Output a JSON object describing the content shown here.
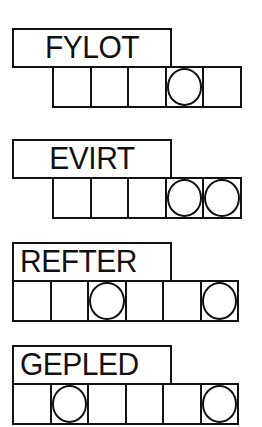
{
  "puzzles": [
    {
      "scrambled": "FYLOT",
      "letter_count": 5,
      "circled_positions": [
        4
      ]
    },
    {
      "scrambled": "EVIRT",
      "letter_count": 5,
      "circled_positions": [
        4,
        5
      ]
    },
    {
      "scrambled": "REFTER",
      "letter_count": 6,
      "circled_positions": [
        3,
        6
      ]
    },
    {
      "scrambled": "GEPLED",
      "letter_count": 6,
      "circled_positions": [
        2,
        6
      ]
    }
  ]
}
